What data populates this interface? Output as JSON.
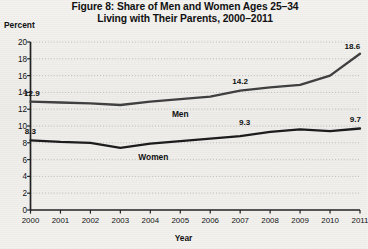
{
  "chart_data": {
    "type": "line",
    "title": "Figure 8: Share of Men and Women Ages 25–34 Living with Their Parents, 2000–2011",
    "title_line1": "Figure 8: Share of Men and Women Ages 25–34",
    "title_line2": "Living with Their Parents, 2000–2011",
    "xlabel": "Year",
    "ylabel": "Percent",
    "xlim": [
      2000,
      2011
    ],
    "ylim": [
      0,
      20
    ],
    "grid": true,
    "legend_position": "inline",
    "ytick_labels": [
      "0",
      "2",
      "4",
      "6",
      "8",
      "10",
      "12",
      "14",
      "16",
      "18",
      "20"
    ],
    "ytick_values": [
      0,
      2,
      4,
      6,
      8,
      10,
      12,
      14,
      16,
      18,
      20
    ],
    "categories": [
      "2000",
      "2001",
      "2002",
      "2003",
      "2004",
      "2005",
      "2006",
      "2007",
      "2008",
      "2009",
      "2010",
      "2011"
    ],
    "x": [
      2000,
      2001,
      2002,
      2003,
      2004,
      2005,
      2006,
      2007,
      2008,
      2009,
      2010,
      2011
    ],
    "series": [
      {
        "name": "Men",
        "color": "#3f3f3f",
        "values": [
          12.9,
          12.8,
          12.7,
          12.5,
          12.9,
          13.2,
          13.5,
          14.2,
          14.6,
          14.9,
          16.0,
          18.6
        ],
        "label_x": 2005,
        "label_y": 11.4
      },
      {
        "name": "Women",
        "color": "#1c1c1c",
        "values": [
          8.3,
          8.1,
          8.0,
          7.4,
          7.9,
          8.2,
          8.5,
          8.8,
          9.3,
          9.6,
          9.4,
          9.7
        ],
        "label_x": 2004.1,
        "label_y": 6.3
      }
    ],
    "annotations": [
      {
        "text": "12.9",
        "x": 2000.05,
        "y": 13.95,
        "series": "Men"
      },
      {
        "text": "14.2",
        "x": 2007.0,
        "y": 15.3,
        "series": "Men"
      },
      {
        "text": "18.6",
        "x": 2010.75,
        "y": 19.55,
        "series": "Men"
      },
      {
        "text": "8.3",
        "x": 2000.0,
        "y": 9.35,
        "series": "Women"
      },
      {
        "text": "9.3",
        "x": 2007.15,
        "y": 10.45,
        "series": "Women"
      },
      {
        "text": "9.7",
        "x": 2010.85,
        "y": 10.8,
        "series": "Women"
      }
    ]
  }
}
